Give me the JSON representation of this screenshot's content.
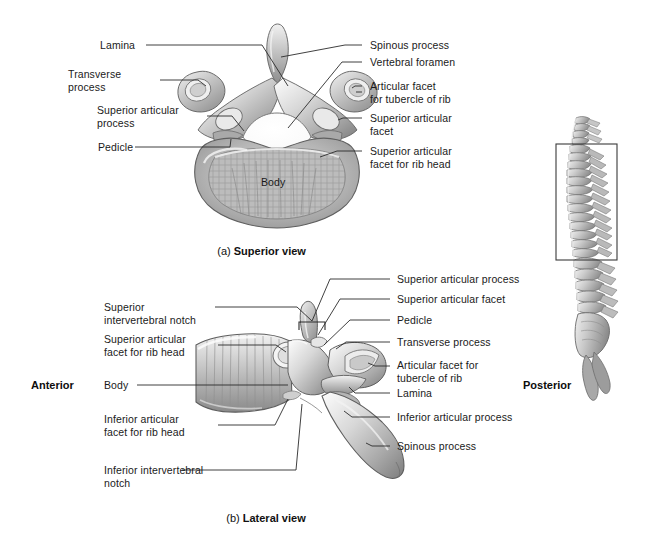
{
  "figure": {
    "background_color": "#ffffff",
    "line_color": "#2b2b2b"
  },
  "orientation": {
    "anterior": "Anterior",
    "posterior": "Posterior"
  },
  "captions": {
    "a_prefix": "(a) ",
    "a_text": "Superior view",
    "b_prefix": "(b) ",
    "b_text": "Lateral view"
  },
  "superior_view": {
    "labels_left": [
      {
        "name": "lamina",
        "text": "Lamina"
      },
      {
        "name": "transverse-process",
        "text": "Transverse\nprocess"
      },
      {
        "name": "superior-articular-process",
        "text": "Superior articular\nprocess"
      },
      {
        "name": "pedicle",
        "text": "Pedicle"
      }
    ],
    "labels_right": [
      {
        "name": "spinous-process",
        "text": "Spinous process"
      },
      {
        "name": "vertebral-foramen",
        "text": "Vertebral foramen"
      },
      {
        "name": "articular-facet-tubercle-rib",
        "text": "Articular facet\nfor tubercle of rib"
      },
      {
        "name": "superior-articular-facet",
        "text": "Superior articular\nfacet"
      },
      {
        "name": "superior-articular-facet-rib-head",
        "text": "Superior articular\nfacet for rib head"
      }
    ],
    "labels_inner": [
      {
        "name": "body",
        "text": "Body"
      }
    ]
  },
  "lateral_view": {
    "labels_left": [
      {
        "name": "superior-intervertebral-notch",
        "text": "Superior\nintervertebral notch"
      },
      {
        "name": "superior-articular-facet-rib-head",
        "text": "Superior articular\nfacet for rib head"
      },
      {
        "name": "body",
        "text": "Body"
      },
      {
        "name": "inferior-articular-facet-rib-head",
        "text": "Inferior articular\nfacet for rib head"
      },
      {
        "name": "inferior-intervertebral-notch",
        "text": "Inferior intervertebral\nnotch"
      }
    ],
    "labels_right": [
      {
        "name": "superior-articular-process",
        "text": "Superior articular process"
      },
      {
        "name": "superior-articular-facet",
        "text": "Superior articular facet"
      },
      {
        "name": "pedicle",
        "text": "Pedicle"
      },
      {
        "name": "transverse-process",
        "text": "Transverse process"
      },
      {
        "name": "articular-facet-tubercle-rib",
        "text": "Articular facet for\ntubercle of rib"
      },
      {
        "name": "lamina",
        "text": "Lamina"
      },
      {
        "name": "inferior-articular-process",
        "text": "Inferior articular process"
      },
      {
        "name": "spinous-process",
        "text": "Spinous process"
      }
    ]
  },
  "spine_inset": {
    "name": "vertebral-column-lateral",
    "highlight_box": {
      "x": 556,
      "y": 144,
      "width": 61,
      "height": 116
    }
  }
}
